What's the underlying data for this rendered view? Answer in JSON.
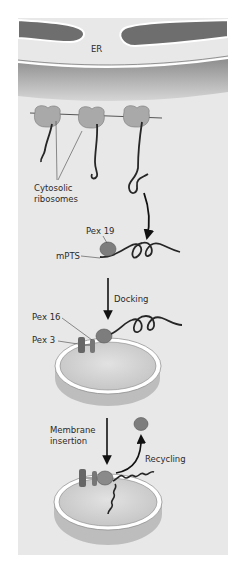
{
  "labels": {
    "er": "ER",
    "ribosomes_line1": "Cytosolic",
    "ribosomes_line2": "ribosomes",
    "pex19": "Pex 19",
    "mpts": "mPTS",
    "docking": "Docking",
    "pex16": "Pex 16",
    "pex3": "Pex 3",
    "membrane_line1": "Membrane",
    "membrane_line2": "insertion",
    "recycling": "Recycling"
  },
  "colors": {
    "page_background": "#ffffff",
    "panel_background": "#e8e8e8",
    "er_lumen": "#6e6e6e",
    "er_membrane": "#ffffff",
    "ribosome": "#a9a9a9",
    "pex19": "#7d7d7d",
    "pex3": "#666666",
    "peroxisome_body": "#cfcfcf",
    "protein_chain": "#262626",
    "arrow": "#111111"
  }
}
